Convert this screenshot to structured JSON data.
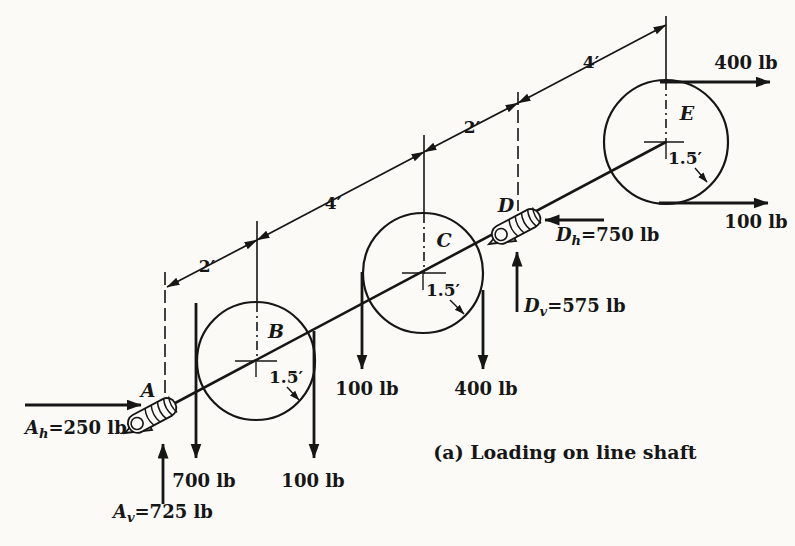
{
  "figure": {
    "caption": "(a) Loading on line shaft",
    "paper_color": "#fbfaf7",
    "ink_color": "#161616"
  },
  "stations": {
    "A": {
      "label": "A",
      "type": "bearing"
    },
    "B": {
      "label": "B",
      "type": "pulley",
      "radius_label": "1.5′"
    },
    "C": {
      "label": "C",
      "type": "pulley",
      "radius_label": "1.5′"
    },
    "D": {
      "label": "D",
      "type": "bearing"
    },
    "E": {
      "label": "E",
      "type": "pulley",
      "radius_label": "1.5′"
    }
  },
  "dimensions": {
    "A_B": "2′",
    "B_C": "4′",
    "C_D": "2′",
    "D_E": "4′"
  },
  "reactions": {
    "Ah": {
      "letter": "A",
      "sub": "h",
      "value": "=250 lb"
    },
    "Av": {
      "letter": "A",
      "sub": "v",
      "value": "=725 lb"
    },
    "Dh": {
      "letter": "D",
      "sub": "h",
      "value": "=750 lb"
    },
    "Dv": {
      "letter": "D",
      "sub": "v",
      "value": "=575 lb"
    }
  },
  "loads": {
    "B_left_down": "700 lb",
    "B_right_down": "100 lb",
    "C_left_down": "100 lb",
    "C_right_down": "400 lb",
    "E_top_right": "400 lb",
    "E_bottom_right": "100 lb"
  }
}
